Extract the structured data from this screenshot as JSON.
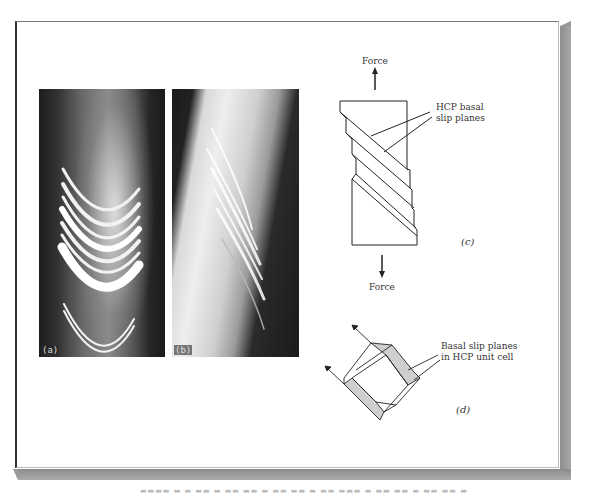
{
  "figure": {
    "panels": {
      "a": {
        "label": "(a)",
        "kind": "photo",
        "description": "single crystal with curved slip bands (front view)"
      },
      "b": {
        "label": "(b)",
        "kind": "photo",
        "description": "single crystal with slip bands (side view)"
      },
      "c": {
        "label": "(c)",
        "kind": "schematic",
        "force_top": "Force",
        "force_bottom": "Force",
        "annotation_line1": "HCP basal",
        "annotation_line2": "slip planes"
      },
      "d": {
        "label": "(d)",
        "kind": "schematic",
        "annotation_line1": "Basal slip planes",
        "annotation_line2": "in HCP unit cell"
      }
    },
    "colors": {
      "frame_border": "#333333",
      "shadow": "#999999",
      "line": "#222222",
      "shaded_face": "#cccccc"
    }
  }
}
